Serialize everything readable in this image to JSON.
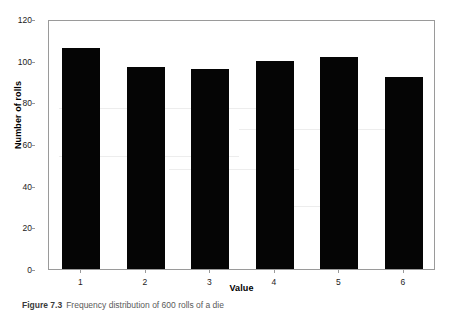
{
  "figure": {
    "caption_label": "Figure 7.3",
    "caption_text": "Frequency distribution of 600 rolls of a die"
  },
  "chart_data": {
    "type": "bar",
    "title": "",
    "subtitle": "",
    "xlabel": "Value",
    "ylabel": "Number of rolls",
    "categories": [
      "1",
      "2",
      "3",
      "4",
      "5",
      "6"
    ],
    "values": [
      106,
      97,
      96,
      100,
      102,
      92
    ],
    "series": [
      {
        "name": "Number of rolls",
        "values": [
          106,
          97,
          96,
          100,
          102,
          92
        ],
        "color": "#050505"
      }
    ],
    "ylim": [
      0,
      120
    ],
    "yticks": [
      0,
      20,
      40,
      60,
      80,
      100,
      120
    ],
    "ytick_labels": [
      "0",
      "20",
      "40",
      "60",
      "80",
      "100",
      "120"
    ],
    "xtick_labels": [
      "1",
      "2",
      "3",
      "4",
      "5",
      "6"
    ],
    "grid": false,
    "legend": false,
    "legend_position": "none",
    "bar_color": "#050505",
    "frame_color": "#9a9a9a",
    "background": "#ffffff"
  }
}
